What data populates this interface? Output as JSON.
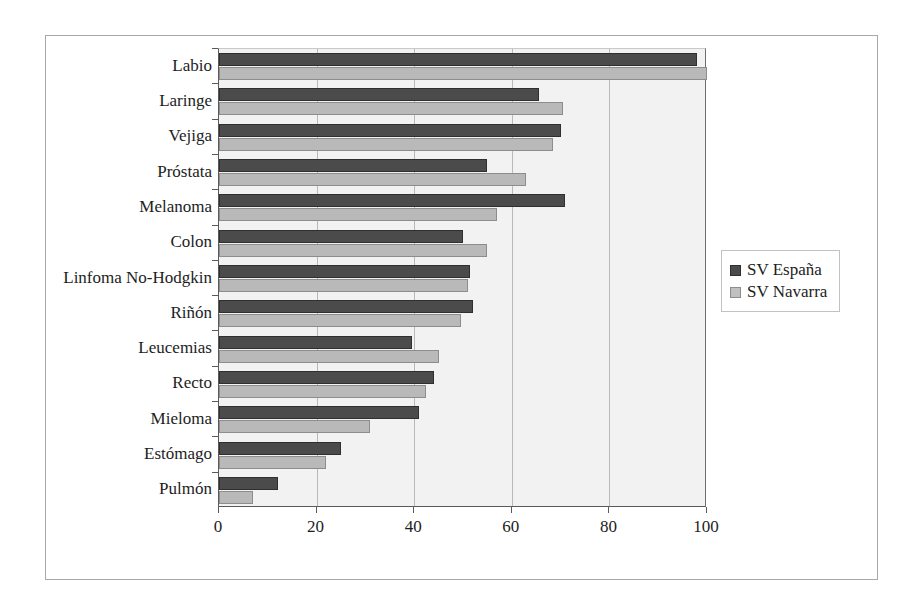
{
  "chart_data": {
    "type": "bar",
    "orientation": "horizontal",
    "title": "",
    "xlabel": "",
    "ylabel": "",
    "xlim": [
      0,
      100
    ],
    "xticks": [
      0,
      20,
      40,
      60,
      80,
      100
    ],
    "grid": true,
    "legend_position": "right",
    "categories": [
      "Labio",
      "Laringe",
      "Vejiga",
      "Próstata",
      "Melanoma",
      "Colon",
      "Linfoma No-Hodgkin",
      "Riñón",
      "Leucemias",
      "Recto",
      "Mieloma",
      "Estómago",
      "Pulmón"
    ],
    "series": [
      {
        "name": "SV España",
        "color": "#4b4b4b",
        "values": [
          98,
          65.5,
          70,
          55,
          71,
          50,
          51.5,
          52,
          39.5,
          44,
          41,
          25,
          12
        ]
      },
      {
        "name": "SV Navarra",
        "color": "#b9b9b9",
        "values": [
          100,
          70.5,
          68.5,
          63,
          57,
          55,
          51,
          49.5,
          45,
          42.5,
          31,
          22,
          7
        ]
      }
    ]
  },
  "legend": {
    "entries": [
      {
        "label": "SV España"
      },
      {
        "label": "SV Navarra"
      }
    ]
  }
}
